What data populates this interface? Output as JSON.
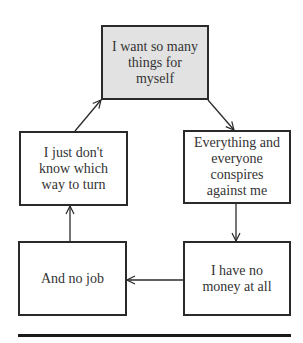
{
  "diagram": {
    "type": "cycle-flowchart",
    "nodes": [
      {
        "id": "want",
        "label": "I want so many things for myself",
        "highlight": true
      },
      {
        "id": "conspires",
        "label": "Everything and everyone conspires against me",
        "highlight": false
      },
      {
        "id": "money",
        "label": "I have no money at all",
        "highlight": false
      },
      {
        "id": "job",
        "label": "And no job",
        "highlight": false
      },
      {
        "id": "turn",
        "label": "I just don't know which way to turn",
        "highlight": false
      }
    ],
    "edges": [
      {
        "from": "want",
        "to": "conspires"
      },
      {
        "from": "conspires",
        "to": "money"
      },
      {
        "from": "money",
        "to": "job"
      },
      {
        "from": "job",
        "to": "turn"
      },
      {
        "from": "turn",
        "to": "want"
      }
    ],
    "colors": {
      "highlight_fill": "#e2e2e2",
      "border": "#2a2a2a",
      "text": "#333333"
    }
  }
}
